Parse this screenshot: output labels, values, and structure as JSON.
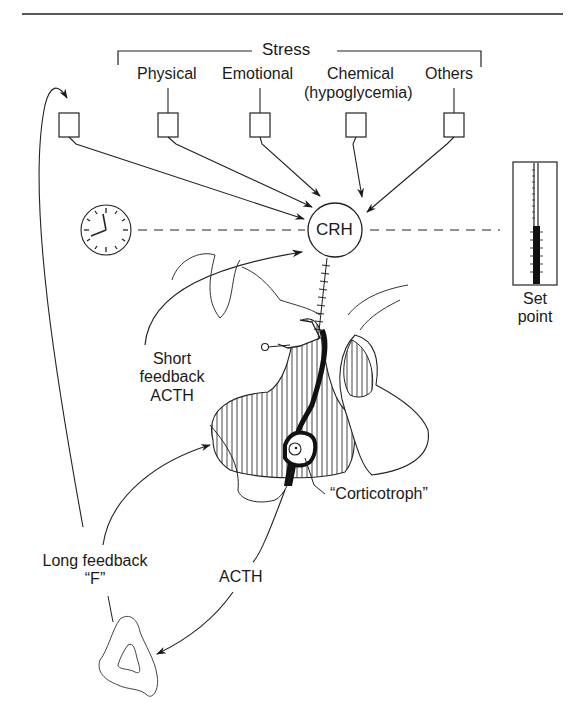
{
  "diagram": {
    "stress": {
      "header": "Stress",
      "categories": [
        {
          "label": "Physical"
        },
        {
          "label": "Emotional"
        },
        {
          "label": "Chemical",
          "sublabel": "(hypoglycemia)"
        },
        {
          "label": "Others"
        }
      ]
    },
    "center_node": "CRH",
    "clock_icon": "clock-icon",
    "set_point": {
      "line1": "Set",
      "line2": "point"
    },
    "short_feedback": {
      "line1": "Short",
      "line2": "feedback",
      "line3": "ACTH"
    },
    "corticotroph_label": "“Corticotroph”",
    "long_feedback": {
      "line1": "Long feedback",
      "line2": "“F”"
    },
    "acth_label": "ACTH",
    "colors": {
      "ink": "#1a1a1a",
      "background": "#ffffff"
    }
  }
}
